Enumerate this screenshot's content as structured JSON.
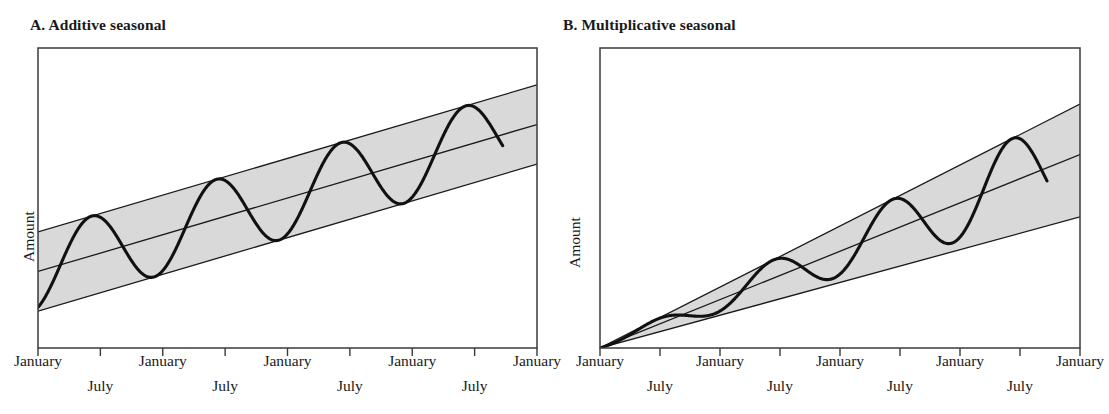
{
  "figure": {
    "background_color": "#ffffff",
    "line_color": "#1a1a1a",
    "band_fill_color": "#d9d9d9",
    "band_edge_color": "#1a1a1a",
    "series_color": "#111111",
    "cropped_caption_fragment": ""
  },
  "panels": [
    {
      "id": "A",
      "title": "A. Additive seasonal",
      "ylabel": "Amount",
      "january_labels": [
        "January",
        "January",
        "January",
        "January",
        "January"
      ],
      "july_labels": [
        "July",
        "July",
        "July",
        "July"
      ]
    },
    {
      "id": "B",
      "title": "B. Multiplicative seasonal",
      "ylabel": "Amount",
      "january_labels": [
        "January",
        "January",
        "January",
        "January",
        "January"
      ],
      "july_labels": [
        "July",
        "July",
        "July",
        "July"
      ]
    }
  ],
  "chart_data": {
    "type": "line",
    "panel_count": 2,
    "panels": [
      {
        "id": "A",
        "title": "A. Additive seasonal",
        "xlabel": "",
        "ylabel": "Amount",
        "grid": false,
        "legend": "none",
        "x_tick_labels": [
          "January",
          "July",
          "January",
          "July",
          "January",
          "July",
          "January",
          "July",
          "January"
        ],
        "x_tick_count": 9,
        "xlim": [
          0,
          8
        ],
        "ylim": [
          0,
          10
        ],
        "description": "Linear upward trend with a constant-amplitude seasonal sine wave; the shaded envelope is a constant-width band of parallel lines (upper bound, trend, lower bound).",
        "series": [
          {
            "name": "trend",
            "kind": "line",
            "x": [
              0,
              8
            ],
            "y": [
              2.55,
              7.45
            ]
          },
          {
            "name": "upper_envelope",
            "kind": "line",
            "x": [
              0,
              8
            ],
            "y": [
              3.87,
              8.77
            ]
          },
          {
            "name": "lower_envelope",
            "kind": "line",
            "x": [
              0,
              8
            ],
            "y": [
              1.23,
              6.13
            ]
          },
          {
            "name": "observed",
            "kind": "sine_on_trend",
            "amplitude_type": "constant",
            "amplitude": 1.32,
            "period_in_x": 2,
            "x_start": 0,
            "x_end": 7.45,
            "peaks_x": [
              0.86,
              2.86,
              4.86,
              6.86
            ],
            "troughs_x": [
              1.86,
              3.86,
              5.86
            ],
            "peaks_y": [
              4.34,
              5.56,
              6.79,
              8.01
            ],
            "troughs_y": [
              2.32,
              3.54,
              4.77
            ]
          }
        ]
      },
      {
        "id": "B",
        "title": "B. Multiplicative seasonal",
        "xlabel": "",
        "ylabel": "Amount",
        "grid": false,
        "legend": "none",
        "x_tick_labels": [
          "January",
          "July",
          "January",
          "July",
          "January",
          "July",
          "January",
          "July",
          "January"
        ],
        "x_tick_count": 9,
        "xlim": [
          0,
          8
        ],
        "ylim": [
          0,
          10
        ],
        "description": "Linear upward trend with a seasonal amplitude proportional to the level; the shaded envelope is a fan (wedge) whose three lines converge at the origin and widen to the right.",
        "series": [
          {
            "name": "trend",
            "kind": "line",
            "x": [
              0,
              8
            ],
            "y": [
              0.0,
              6.45
            ]
          },
          {
            "name": "upper_envelope",
            "kind": "line",
            "x": [
              0,
              8
            ],
            "y": [
              0.0,
              8.13
            ]
          },
          {
            "name": "lower_envelope",
            "kind": "line",
            "x": [
              0,
              8
            ],
            "y": [
              0.0,
              4.37
            ]
          },
          {
            "name": "observed",
            "kind": "sine_on_trend",
            "amplitude_type": "proportional",
            "amplitude_ratio": 0.26,
            "period_in_x": 2,
            "x_start": 0,
            "x_end": 7.45,
            "peaks_x": [
              0.86,
              2.86,
              4.86,
              6.86
            ],
            "troughs_x": [
              1.86,
              3.86,
              5.86
            ],
            "peaks_y": [
              0.87,
              2.9,
              4.93,
              6.97
            ],
            "troughs_y": [
              0.94,
              2.24,
              3.54
            ]
          }
        ]
      }
    ]
  }
}
